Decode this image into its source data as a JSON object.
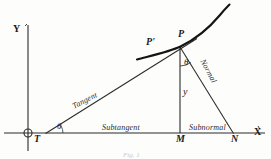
{
  "figure": {
    "caption": "Fig. 1",
    "stroke_color": "#1a1a1a",
    "background_color": "#fdfdfc"
  },
  "axes": {
    "y_label": "Y",
    "x_label": "X",
    "origin_marker": "origin-circle"
  },
  "points": {
    "T": "T",
    "M": "M",
    "N": "N",
    "P": "P",
    "P_prime": "P'"
  },
  "angles": {
    "theta_at_T": "θ",
    "theta_at_P": "θ"
  },
  "variables": {
    "ordinate": "y"
  },
  "segments": {
    "tangent": "Tangent",
    "normal": "Normal",
    "subtangent": "Subtangent",
    "subnormal": "Subnormal"
  },
  "geometry": {
    "origin": [
      28,
      133
    ],
    "y_axis": [
      [
        28,
        25
      ],
      [
        28,
        151
      ]
    ],
    "x_axis": [
      [
        4,
        133
      ],
      [
        265,
        133
      ]
    ],
    "tangent_line": [
      [
        46,
        133
      ],
      [
        196,
        39
      ]
    ],
    "normal_line": [
      [
        180,
        47
      ],
      [
        233,
        133
      ]
    ],
    "ordinate_line": [
      [
        180,
        47
      ],
      [
        180,
        133
      ]
    ],
    "curve": [
      [
        137,
        59
      ],
      [
        180,
        47
      ],
      [
        205,
        32
      ],
      [
        229,
        5
      ]
    ],
    "T_point": [
      46,
      133
    ],
    "M_point": [
      180,
      133
    ],
    "N_point": [
      233,
      133
    ],
    "P_point": [
      180,
      47
    ]
  }
}
